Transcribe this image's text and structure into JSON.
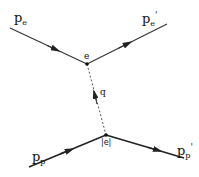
{
  "diagram": {
    "labels": {
      "pe": {
        "main": "p",
        "sub": "e"
      },
      "pe_prime": {
        "main": "p",
        "sub": "e",
        "sup": "'"
      },
      "vertex_top": "e",
      "photon": "q",
      "pp": {
        "main": "p",
        "sub": "p"
      },
      "pp_prime": {
        "main": "p",
        "sub": "p",
        "sup": "'"
      },
      "vertex_bottom": "|e|"
    },
    "colors": {
      "line": "#222222",
      "background": "#ffffff"
    }
  }
}
